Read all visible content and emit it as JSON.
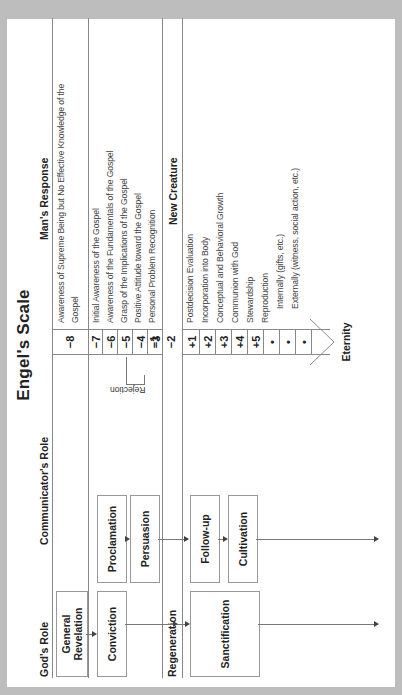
{
  "title": "Engel's Scale",
  "columns": {
    "gods_role": "God's Role",
    "communicators_role": "Communicator's Role",
    "mans_response": "Man's Response"
  },
  "gods_role": {
    "general_revelation_line1": "General",
    "general_revelation_line2": "Revelation",
    "conviction": "Conviction",
    "regeneration": "Regeneration",
    "sanctification": "Sanctification"
  },
  "communicators_role": {
    "proclamation": "Proclamation",
    "persuasion": "Persuasion",
    "follow_up": "Follow-up",
    "cultivation": "Cultivation"
  },
  "rejection_label": "Rejection",
  "scale": {
    "pre": [
      {
        "num": "−8",
        "text_line1": "Awareness of Supreme Being but No Effective Knowledge of the",
        "text_line2": "Gospel"
      },
      {
        "num": "−7",
        "text": "Initial Awareness of the Gospel"
      },
      {
        "num": "−6",
        "text": "Awareness of the Fundamentals of the Gospel"
      },
      {
        "num": "−5",
        "text": "Grasp of the Implications of the Gospel"
      },
      {
        "num": "−4",
        "text": "Positive Attitude toward the Gospel"
      },
      {
        "num": "−3",
        "text": "Personal Problem Recognition"
      },
      {
        "num": "−2",
        "text": "Decision to Act"
      },
      {
        "num": "−1",
        "text": "Repentance and Faith in Christ"
      }
    ],
    "new_creature_label": "New Creature",
    "post": [
      {
        "num": "+1",
        "text": "Postdecision Evaluation"
      },
      {
        "num": "+2",
        "text": "Incorporation into Body"
      },
      {
        "num": "+3",
        "text": "Conceptual and Behavioral Growth"
      },
      {
        "num": "+4",
        "text": "Communion with God"
      },
      {
        "num": "+5",
        "text": "Stewardship"
      },
      {
        "num": "•",
        "text": "Reproduction"
      },
      {
        "num": "•",
        "text": "Internally (gifts, etc.)"
      },
      {
        "num": "•",
        "text": "Externally (witness, social action, etc.)"
      }
    ],
    "eternity": "Eternity"
  }
}
